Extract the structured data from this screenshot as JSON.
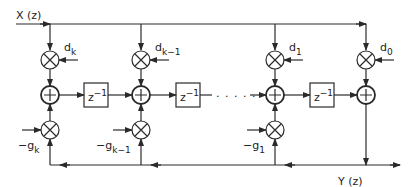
{
  "diagram": {
    "type": "signal-flow block diagram (lattice/ladder filter)",
    "input_label": "X (z)",
    "output_label": "Y (z)",
    "delay_label": {
      "base": "z",
      "exp": "−1"
    },
    "ellipsis": ". . . . .",
    "columns": [
      {
        "id": "k",
        "d_base": "d",
        "d_sub": "k",
        "g_base": "−g",
        "g_sub": "k"
      },
      {
        "id": "k-1",
        "d_base": "d",
        "d_sub": "k−1",
        "g_base": "−g",
        "g_sub": "k−1"
      },
      {
        "id": "1",
        "d_base": "d",
        "d_sub": "1",
        "g_base": "−g",
        "g_sub": "1"
      },
      {
        "id": "0",
        "d_base": "d",
        "d_sub": "0"
      }
    ],
    "colors": {
      "stroke": "#2a2a2a",
      "background": "#ffffff"
    }
  }
}
